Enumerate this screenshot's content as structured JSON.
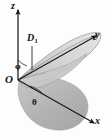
{
  "figure": {
    "type": "3d-coordinate-diagram",
    "background_color": "#fdfdfd",
    "line_color": "#1a1a1a",
    "axes": [
      {
        "name": "z-axis",
        "label": "z",
        "direction": "up"
      },
      {
        "name": "y-axis",
        "label": "y",
        "direction": "upper-right"
      },
      {
        "name": "x-axis",
        "label": "x",
        "direction": "lower-right"
      }
    ],
    "origin": {
      "name": "origin",
      "label": "O"
    },
    "angles": [
      {
        "name": "phi",
        "label": "φ",
        "measured_from": "z-axis"
      },
      {
        "name": "theta",
        "label": "θ",
        "measured_from": "x-axis"
      }
    ],
    "regions": [
      {
        "name": "region-D1",
        "label": "D",
        "subscript": "1",
        "fill_color": "#c9c9c9",
        "stroke_color": "#6e6e6e",
        "shape": "upper conical sheet / petal"
      },
      {
        "name": "projection-shadow",
        "label": "",
        "fill_color": "#b4b4b4",
        "stroke_color": "#9a9a9a",
        "shape": "lower shaded cone sector"
      }
    ],
    "leader_line": {
      "name": "d1-leader-line",
      "from_label": "D",
      "to_region": "region-D1"
    }
  }
}
